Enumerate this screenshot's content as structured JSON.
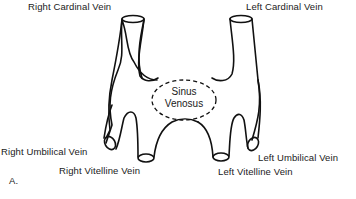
{
  "diagram": {
    "panel_label": "A.",
    "labels": {
      "right_cardinal": "Right Cardinal Vein",
      "left_cardinal": "Left Cardinal Vein",
      "sinus_line1": "Sinus",
      "sinus_line2": "Venosus",
      "right_umbilical": "Right Umbilical Vein",
      "right_vitelline": "Right Vitelline Vein",
      "left_umbilical": "Left Umbilical Vein",
      "left_vitelline": "Left Vitelline Vein"
    },
    "colors": {
      "stroke": "#111111",
      "background": "#ffffff"
    }
  }
}
